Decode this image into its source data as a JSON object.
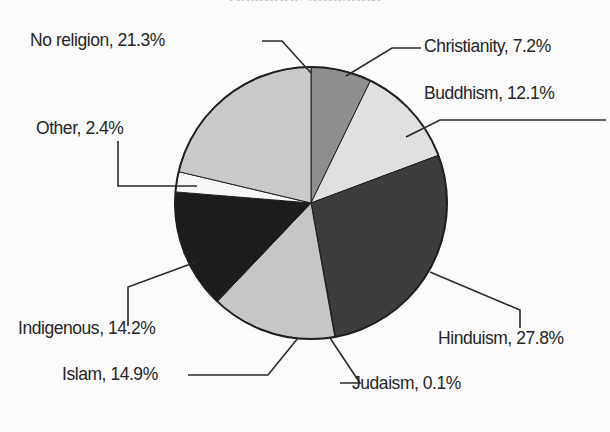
{
  "chart_data": {
    "type": "pie",
    "title": "Religious affiliation",
    "xlabel": "",
    "ylabel": "",
    "legend_position": "callout-labels",
    "grid": false,
    "unit": "%",
    "categories": [
      "Christianity",
      "Buddhism",
      "Hinduism",
      "Judaism",
      "Islam",
      "Indigenous",
      "Other",
      "No religion"
    ],
    "values": [
      7.2,
      12.1,
      27.8,
      0.1,
      14.9,
      14.2,
      2.4,
      21.3
    ],
    "slices": [
      {
        "name": "Christianity",
        "label": "Christianity, 7.2%",
        "value": 7.2,
        "color": "#8f8f8f",
        "start_angle": 0,
        "end_angle": 25.92
      },
      {
        "name": "Buddhism",
        "label": "Buddhism, 12.1%",
        "value": 12.1,
        "color": "#e0e0e0",
        "start_angle": 25.92,
        "end_angle": 69.48
      },
      {
        "name": "Hinduism",
        "label": "Hinduism, 27.8%",
        "value": 27.8,
        "color": "#3d3d3d",
        "start_angle": 69.48,
        "end_angle": 169.56
      },
      {
        "name": "Judaism",
        "label": "Judaism, 0.1%",
        "value": 0.1,
        "color": "#5a5a5a",
        "start_angle": 169.56,
        "end_angle": 169.92
      },
      {
        "name": "Islam",
        "label": "Islam, 14.9%",
        "value": 14.9,
        "color": "#c6c6c6",
        "start_angle": 169.92,
        "end_angle": 223.56
      },
      {
        "name": "Indigenous",
        "label": "Indigenous, 14.2%",
        "value": 14.2,
        "color": "#1c1c1c",
        "start_angle": 223.56,
        "end_angle": 274.68
      },
      {
        "name": "Other",
        "label": "Other, 2.4%",
        "value": 2.4,
        "color": "#f7f7f7",
        "start_angle": 274.68,
        "end_angle": 283.32
      },
      {
        "name": "No religion",
        "label": "No religion, 21.3%",
        "value": 21.3,
        "color": "#cacaca",
        "start_angle": 283.32,
        "end_angle": 360
      }
    ],
    "geometry": {
      "center_x": 311,
      "center_y": 203,
      "radius": 136
    }
  },
  "labels": {
    "no_religion": "No religion, 21.3%",
    "christianity": "Christianity, 7.2%",
    "buddhism": "Buddhism, 12.1%",
    "other": "Other, 2.4%",
    "hinduism": "Hinduism, 27.8%",
    "judaism": "Judaism, 0.1%",
    "islam": "Islam, 14.9%",
    "indigenous": "Indigenous, 14.2%"
  },
  "colors": {
    "background": "#fbfbfb",
    "outline": "#1f1f1f",
    "leader_line": "#2a2a2a",
    "text": "#252525"
  }
}
